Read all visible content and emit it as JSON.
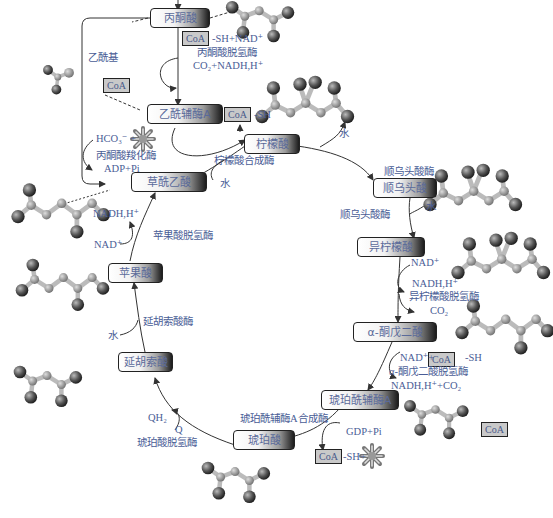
{
  "diagram": {
    "colors": {
      "text": "#4a5d96",
      "box_border": "#222222",
      "coa_fill": "#c9c9c9",
      "arrow": "#333333"
    },
    "metabolites": [
      {
        "id": "pyruvate",
        "label": "丙酮酸"
      },
      {
        "id": "acetyl_coa",
        "label": "乙酰辅酶A"
      },
      {
        "id": "citrate",
        "label": "柠檬酸"
      },
      {
        "id": "cis_aconitate",
        "label": "顺乌头酸"
      },
      {
        "id": "isocitrate",
        "label": "异柠檬酸"
      },
      {
        "id": "alpha_kg",
        "label": "α-酮戊二酸"
      },
      {
        "id": "succinyl_coa",
        "label": "琥珀酰辅酶A"
      },
      {
        "id": "succinate",
        "label": "琥珀酸"
      },
      {
        "id": "fumarate",
        "label": "延胡索酸"
      },
      {
        "id": "malate",
        "label": "苹果酸"
      },
      {
        "id": "oxaloacetate",
        "label": "草酰乙酸"
      }
    ],
    "coa_tags": {
      "label": "CoA"
    },
    "enzymes": {
      "pdh": "丙酮酸脱氢酶",
      "pyruvate_carboxylase": "丙酮酸羧化酶",
      "citrate_synthase": "柠檬酸合成酶",
      "aconitase_1": "顺乌头酸酶",
      "aconitase_2": "顺乌头酸酶",
      "idh": "异柠檬酸脱氢酶",
      "akgdh": "α-酮戊二酸脱氢酶",
      "scs": "琥珀酰辅酶A合成酶",
      "sdh": "琥珀酸脱氢酶",
      "fumarase": "延胡索酸酶",
      "mdh": "苹果酸脱氢酶"
    },
    "cofactors": {
      "acetyl_group": "乙酰基",
      "pdh_in": "-SH+NAD⁺",
      "pdh_out": "CO₂+NADH,H⁺",
      "acetylcoa_release": "-SH",
      "hco3": "HCO₃⁻ +",
      "adp_pi": "ADP+Pi",
      "water_citrate": "水",
      "water_aconitase": "水",
      "water_aconitase_2": "水",
      "idh_nad": "NAD⁺",
      "idh_nadh": "NADH,H⁺",
      "idh_co2": "CO₂",
      "akg_in": "NAD⁺+",
      "akg_sh": "-SH",
      "akg_out": "NADH,H⁺+CO₂",
      "gdp_pi": "GDP+Pi",
      "scs_sh": "-SH+",
      "qh2": "QH₂",
      "q": "Q",
      "water_fumarase": "水",
      "mdh_nad": "NAD⁺",
      "mdh_nadh": "NADH,H⁺"
    }
  }
}
